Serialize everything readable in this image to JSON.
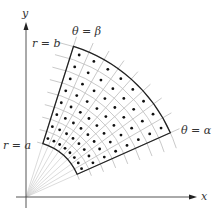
{
  "labels": {
    "x_axis": "x",
    "y_axis": "y",
    "inner_radius": "r = a",
    "outer_radius": "r = b",
    "start_angle": "θ = α",
    "end_angle": "θ = β"
  },
  "geometry": {
    "origin": [
      26,
      197
    ],
    "x_axis_end": 197,
    "x_axis_start": 16,
    "y_axis_end": 22,
    "y_axis_start": 208,
    "inner_r": 56,
    "outer_r": 158,
    "alpha_deg": 24,
    "beta_deg": 72.5,
    "radial_divisions": 8,
    "angular_divisions": 8,
    "radial_line_extent": 168,
    "arc_overshoot_deg": 6
  },
  "colors": {
    "axis": "#555555",
    "grid": "#bbbbbb",
    "boundary": "#222222",
    "dot": "#111111",
    "fan": "#cccccc"
  },
  "label_positions": {
    "x_axis": [
      201,
      200
    ],
    "y_axis": [
      22,
      17
    ],
    "inner_radius": [
      3,
      149
    ],
    "outer_radius": [
      32,
      47
    ],
    "start_angle": [
      181,
      134
    ],
    "end_angle": [
      72,
      35
    ]
  }
}
